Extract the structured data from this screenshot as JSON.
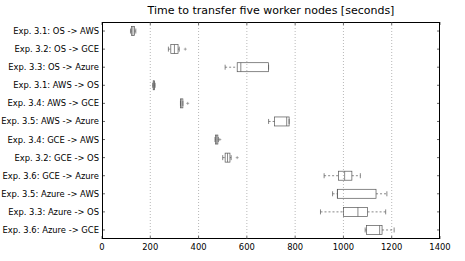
{
  "chart_data": {
    "type": "boxplot",
    "orientation": "horizontal",
    "title": "Time to transfer five worker nodes [seconds]",
    "xlabel": "",
    "ylabel": "",
    "xlim": [
      0,
      1400
    ],
    "xticks": [
      0,
      200,
      400,
      600,
      800,
      1000,
      1200,
      1400
    ],
    "grid": "vertical dotted",
    "series": [
      {
        "name": "Exp. 3.1: OS -> AWS",
        "whisker_low": 118,
        "q1": 122,
        "median": 128,
        "q3": 135,
        "whisker_high": 140,
        "outliers": []
      },
      {
        "name": "Exp. 3.2: OS -> GCE",
        "whisker_low": 275,
        "q1": 285,
        "median": 300,
        "q3": 315,
        "whisker_high": 320,
        "outliers": [
          345
        ]
      },
      {
        "name": "Exp. 3.3: OS -> Azure",
        "whisker_low": 510,
        "q1": 560,
        "median": 575,
        "q3": 690,
        "whisker_high": 690,
        "outliers": []
      },
      {
        "name": "Exp. 3.1: AWS -> OS",
        "whisker_low": 210,
        "q1": 212,
        "median": 215,
        "q3": 218,
        "whisker_high": 220,
        "outliers": []
      },
      {
        "name": "Exp. 3.4: AWS -> GCE",
        "whisker_low": 325,
        "q1": 325,
        "median": 328,
        "q3": 335,
        "whisker_high": 335,
        "outliers": [
          355
        ]
      },
      {
        "name": "Exp. 3.5: AWS -> Azure",
        "whisker_low": 690,
        "q1": 715,
        "median": 765,
        "q3": 775,
        "whisker_high": 775,
        "outliers": []
      },
      {
        "name": "Exp. 3.4: GCE -> AWS",
        "whisker_low": 468,
        "q1": 470,
        "median": 475,
        "q3": 480,
        "whisker_high": 482,
        "outliers": [
          488
        ]
      },
      {
        "name": "Exp. 3.2: GCE -> OS",
        "whisker_low": 500,
        "q1": 510,
        "median": 520,
        "q3": 530,
        "whisker_high": 535,
        "outliers": [
          560
        ]
      },
      {
        "name": "Exp. 3.6: GCE -> Azure",
        "whisker_low": 920,
        "q1": 980,
        "median": 1005,
        "q3": 1035,
        "whisker_high": 1070,
        "outliers": []
      },
      {
        "name": "Exp. 3.5: Azure -> AWS",
        "whisker_low": 955,
        "q1": 975,
        "median": 975,
        "q3": 1135,
        "whisker_high": 1180,
        "outliers": []
      },
      {
        "name": "Exp. 3.3: Azure -> OS",
        "whisker_low": 905,
        "q1": 1000,
        "median": 1060,
        "q3": 1100,
        "whisker_high": 1175,
        "outliers": []
      },
      {
        "name": "Exp. 3.6: Azure -> GCE",
        "whisker_low": 1090,
        "q1": 1095,
        "median": 1150,
        "q3": 1160,
        "whisker_high": 1210,
        "outliers": []
      }
    ]
  },
  "colors": {
    "box": "#555555",
    "grid": "#888888",
    "axis": "#000000"
  }
}
